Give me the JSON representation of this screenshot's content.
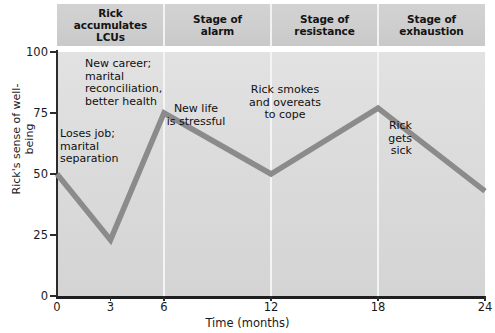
{
  "chart_data": {
    "type": "line",
    "title": "",
    "xlabel": "Time (months)",
    "ylabel": "Rick's sense\nof well-being",
    "xlim": [
      0,
      24
    ],
    "ylim": [
      0,
      100
    ],
    "grid": false,
    "legend": "none",
    "x_ticks": [
      {
        "value": 0,
        "label": "0"
      },
      {
        "value": 3,
        "label": "3"
      },
      {
        "value": 6,
        "label": "6"
      },
      {
        "value": 12,
        "label": "12"
      },
      {
        "value": 18,
        "label": "18"
      },
      {
        "value": 24,
        "label": "24"
      }
    ],
    "y_ticks": [
      {
        "value": 0,
        "label": "0"
      },
      {
        "value": 25,
        "label": "25"
      },
      {
        "value": 50,
        "label": "50"
      },
      {
        "value": 75,
        "label": "75"
      },
      {
        "value": 100,
        "label": "100"
      }
    ],
    "series": [
      {
        "name": "Rick's sense of well-being",
        "color": "#8b8b8b",
        "x": [
          0,
          3,
          6,
          12,
          18,
          24
        ],
        "values": [
          50,
          23,
          75,
          50,
          77,
          43
        ]
      }
    ],
    "stage_dividers": [
      6,
      12,
      18
    ],
    "stages": [
      {
        "label": "Rick\naccumulates\nLCUs",
        "start": 0,
        "end": 6
      },
      {
        "label": "Stage of\nalarm",
        "start": 6,
        "end": 12
      },
      {
        "label": "Stage of\nresistance",
        "start": 12,
        "end": 18
      },
      {
        "label": "Stage of\nexhaustion",
        "start": 18,
        "end": 24
      }
    ],
    "annotations": [
      {
        "text": "Loses job;\nmarital\nseparation",
        "align": "left",
        "x": 60,
        "y": 128
      },
      {
        "text": "New career;\nmarital\nreconciliation,\nbetter health",
        "align": "left",
        "x": 85,
        "y": 58
      },
      {
        "text": "New life\nis stressful",
        "align": "center",
        "x": 196,
        "y": 103
      },
      {
        "text": "Rick smokes\nand overeats\nto cope",
        "align": "center",
        "x": 285,
        "y": 84
      },
      {
        "text": "Rick\ngets\nsick",
        "align": "right",
        "x": 412,
        "y": 120
      }
    ]
  },
  "colors": {
    "line": "#8b8b8b",
    "plot_background": "#dcdcdc",
    "header_background": "#cfcfcf",
    "divider": "#f4f4f4",
    "axis": "#1f1f1f",
    "text": "#101010"
  }
}
